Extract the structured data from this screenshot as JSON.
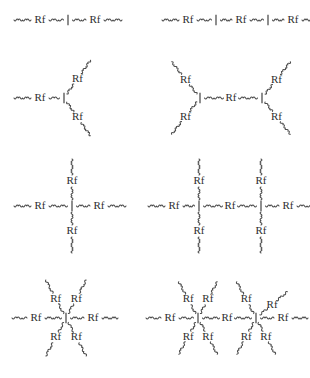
{
  "figure": {
    "title": "",
    "background_color": "#ffffff",
    "line_color": "#4a4a4a",
    "text_color": "#2e2e2e",
    "segment_label": "Rf",
    "junction_label": "I",
    "arm_glyph": "wavy-chain"
  },
  "structures": [
    {
      "id": "linear-diblock",
      "name": "linear-two-segment",
      "position": "top-left",
      "arm_count": 2,
      "junction_count": 1,
      "rf_count": 2,
      "center": [
        68,
        20
      ],
      "junction_label": "I",
      "arms": [
        {
          "label": "Rf",
          "angle": 180
        },
        {
          "label": "Rf",
          "angle": 0
        }
      ]
    },
    {
      "id": "linear-triblock",
      "name": "linear-three-segment",
      "position": "top-right",
      "arm_count": 3,
      "junction_count": 2,
      "rf_count": 3,
      "center": [
        228,
        20
      ],
      "junction_label": "I",
      "arms": [
        {
          "label": "Rf",
          "angle": 180
        },
        {
          "label": "Rf",
          "angle": 0
        },
        {
          "label": "Rf",
          "angle": 0
        }
      ]
    },
    {
      "id": "three-arm-star",
      "name": "three-arm-star",
      "position": "middle-left",
      "arm_count": 3,
      "junction_count": 1,
      "rf_count": 3,
      "center": [
        64,
        98
      ],
      "junction_label": "I",
      "arms": [
        {
          "label": "Rf",
          "angle": 180
        },
        {
          "label": "Rf",
          "angle": -55
        },
        {
          "label": "Rf",
          "angle": 55
        }
      ]
    },
    {
      "id": "h-shaped",
      "name": "h-shaped-four-arm",
      "position": "middle-right",
      "arm_count": 5,
      "junction_count": 2,
      "rf_count": 5,
      "center": [
        228,
        98
      ],
      "junction_label": "I",
      "arms": [
        {
          "label": "Rf",
          "angle": -135
        },
        {
          "label": "Rf",
          "angle": 135
        },
        {
          "label": "Rf",
          "angle": 0
        },
        {
          "label": "Rf",
          "angle": -45
        },
        {
          "label": "Rf",
          "angle": 45
        }
      ]
    },
    {
      "id": "four-arm-cross",
      "name": "four-arm-cross-star",
      "position": "row3-left",
      "arm_count": 4,
      "junction_count": 1,
      "rf_count": 4,
      "center": [
        72,
        206
      ],
      "junction_label": "I",
      "arms": [
        {
          "label": "Rf",
          "angle": 180
        },
        {
          "label": "Rf",
          "angle": 0
        },
        {
          "label": "Rf",
          "angle": -90
        },
        {
          "label": "Rf",
          "angle": 90
        }
      ]
    },
    {
      "id": "double-cross",
      "name": "linked-double-cross",
      "position": "row3-right",
      "arm_count": 7,
      "junction_count": 2,
      "rf_count": 7,
      "center": [
        228,
        206
      ],
      "junction_label": "I",
      "arms": [
        {
          "label": "Rf",
          "angle": 180
        },
        {
          "label": "Rf",
          "angle": -90
        },
        {
          "label": "Rf",
          "angle": 90
        },
        {
          "label": "Rf",
          "angle": 0
        },
        {
          "label": "Rf",
          "angle": -90
        },
        {
          "label": "Rf",
          "angle": 90
        },
        {
          "label": "Rf",
          "angle": 0
        }
      ]
    },
    {
      "id": "six-arm-star",
      "name": "six-arm-star",
      "position": "bottom-left",
      "arm_count": 6,
      "junction_count": 1,
      "rf_count": 6,
      "center": [
        66,
        318
      ],
      "junction_label": "I",
      "arms": [
        {
          "label": "Rf",
          "angle": 180
        },
        {
          "label": "Rf",
          "angle": 0
        },
        {
          "label": "Rf",
          "angle": -120
        },
        {
          "label": "Rf",
          "angle": -60
        },
        {
          "label": "Rf",
          "angle": 120
        },
        {
          "label": "Rf",
          "angle": 60
        }
      ]
    },
    {
      "id": "double-six-arm-star",
      "name": "linked-double-six-arm-star",
      "position": "bottom-right",
      "arm_count": 11,
      "junction_count": 2,
      "rf_count": 11,
      "center": [
        228,
        318
      ],
      "junction_label": "I",
      "arms": [
        {
          "label": "Rf",
          "angle": 180
        },
        {
          "label": "Rf",
          "angle": -120
        },
        {
          "label": "Rf",
          "angle": -60
        },
        {
          "label": "Rf",
          "angle": 120
        },
        {
          "label": "Rf",
          "angle": 60
        },
        {
          "label": "Rf",
          "angle": 0
        },
        {
          "label": "Rf",
          "angle": -120
        },
        {
          "label": "Rf",
          "angle": -60
        },
        {
          "label": "Rf",
          "angle": 120
        },
        {
          "label": "Rf",
          "angle": 60
        },
        {
          "label": "Rf",
          "angle": 0
        }
      ]
    }
  ]
}
